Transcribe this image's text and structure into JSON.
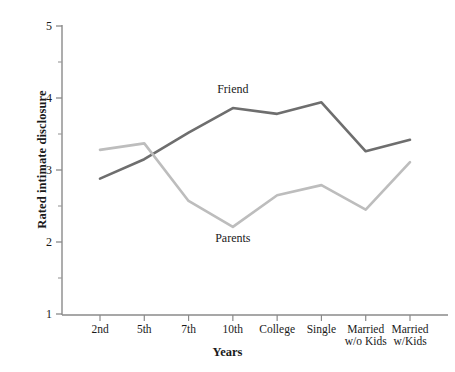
{
  "chart_data": {
    "type": "line",
    "title": "",
    "xlabel": "Years",
    "ylabel": "Rated intimate disclosure",
    "categories": [
      "2nd",
      "5th",
      "7th",
      "10th",
      "College",
      "Single",
      "Married\nw/o Kids",
      "Married\nw/Kids"
    ],
    "xtick_labels": [
      "2nd",
      "5th",
      "7th",
      "10th",
      "College",
      "Single",
      "Married w/o Kids",
      "Married w/Kids"
    ],
    "ylim": [
      1,
      5
    ],
    "ytick_labels": [
      "1",
      "2",
      "3",
      "4",
      "5"
    ],
    "ytick_values": [
      1,
      2,
      3,
      4,
      5
    ],
    "yminor_values": [
      1.5,
      2.5,
      3.5,
      4.5
    ],
    "grid": false,
    "legend_position": "inline-annotations",
    "series": [
      {
        "name": "Friend",
        "color": "#6e6e6e",
        "values": [
          2.88,
          3.15,
          3.52,
          3.86,
          3.78,
          3.94,
          3.26,
          3.42
        ]
      },
      {
        "name": "Parents",
        "color": "#bdbdbd",
        "values": [
          3.28,
          3.37,
          2.57,
          2.21,
          2.65,
          2.79,
          2.45,
          3.11
        ]
      }
    ],
    "annotations": [
      {
        "text": "Friend",
        "category": "10th",
        "value": 4.12
      },
      {
        "text": "Parents",
        "category": "10th",
        "value": 2.05
      }
    ]
  },
  "axis": {
    "y_title": "Rated intimate disclosure",
    "x_title": "Years"
  }
}
